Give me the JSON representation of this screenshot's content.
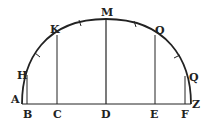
{
  "figure": {
    "type": "geometric-diagram",
    "colors": {
      "ink": "#222222",
      "background": "#ffffff"
    },
    "points": {
      "A": {
        "label": "A",
        "x": 22,
        "y": 104
      },
      "B": {
        "label": "B",
        "x": 27,
        "y": 104
      },
      "C": {
        "label": "C",
        "x": 57,
        "y": 104
      },
      "D": {
        "label": "D",
        "x": 106,
        "y": 104
      },
      "E": {
        "label": "E",
        "x": 154,
        "y": 104
      },
      "F": {
        "label": "F",
        "x": 185,
        "y": 104
      },
      "Z": {
        "label": "Z",
        "x": 191,
        "y": 104
      },
      "H": {
        "label": "H",
        "x": 27,
        "y": 75
      },
      "K": {
        "label": "K",
        "x": 57,
        "y": 36
      },
      "M": {
        "label": "M",
        "x": 106,
        "y": 19
      },
      "O": {
        "label": "O",
        "x": 156,
        "y": 36
      },
      "Q": {
        "label": "Q",
        "x": 185,
        "y": 76
      }
    },
    "segments": [
      {
        "name": "baseline",
        "from": "A",
        "to": "Z"
      },
      {
        "name": "ordinate-HB",
        "from": "H",
        "to": "B"
      },
      {
        "name": "ordinate-KC",
        "from": "K",
        "to": "C"
      },
      {
        "name": "ordinate-MD",
        "from": "M",
        "to": "D"
      },
      {
        "name": "ordinate-OE",
        "from": "O",
        "to": "E"
      },
      {
        "name": "ordinate-QF",
        "from": "Q",
        "to": "F"
      }
    ],
    "arc": {
      "from": "A",
      "through": "M",
      "to": "Z"
    },
    "tick_marks": 4
  }
}
